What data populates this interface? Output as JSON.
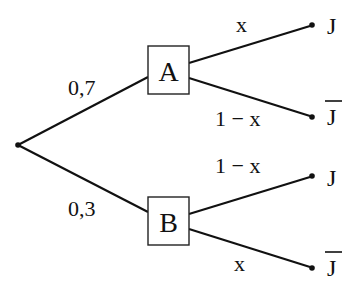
{
  "diagram": {
    "type": "probability-tree",
    "root": {
      "branches": [
        {
          "probability": "0,7",
          "node": "A",
          "branches": [
            {
              "probability": "x",
              "outcome": "J",
              "overline": false
            },
            {
              "probability": "1 − x",
              "outcome": "J",
              "overline": true
            }
          ]
        },
        {
          "probability": "0,3",
          "node": "B",
          "branches": [
            {
              "probability": "1 − x",
              "outcome": "J",
              "overline": false
            },
            {
              "probability": "x",
              "outcome": "J",
              "overline": true
            }
          ]
        }
      ]
    }
  }
}
